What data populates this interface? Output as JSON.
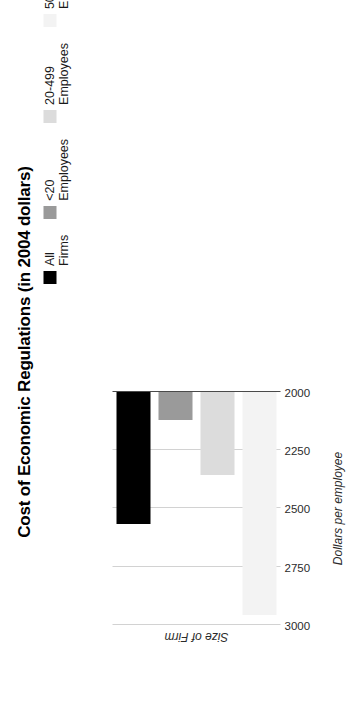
{
  "chart_data": {
    "type": "bar",
    "orientation": "horizontal",
    "title": "Cost of Economic Regulations (in 2004 dollars)",
    "xlabel": "Size of Firm",
    "ylabel": "Dollars per employee",
    "categories": [
      "All Firms",
      "<20 Employees",
      "20-499 Employees",
      "500+ Employees"
    ],
    "values": [
      2565,
      2120,
      2357,
      2955
    ],
    "value_axis_ticks": [
      "2000",
      "2250",
      "2500",
      "2750",
      "3000"
    ],
    "value_axis_tick_values": [
      2000,
      2250,
      2500,
      2750,
      3000
    ],
    "ylim": [
      2000,
      3000
    ],
    "grid": true,
    "legend_position": "top-right",
    "series": [
      {
        "name": "All Firms",
        "value": 2565,
        "color": "#000000"
      },
      {
        "name": "<20 Employees",
        "value": 2120,
        "color": "#9a9a9a"
      },
      {
        "name": "20-499 Employees",
        "value": 2357,
        "color": "#dcdcdc"
      },
      {
        "name": "500+ Employees",
        "value": 2955,
        "color": "#f3f3f3"
      }
    ]
  },
  "figure": {
    "title": "Cost of Economic Regulations (in 2004 dollars)",
    "value_axis_title": "Dollars per employee",
    "category_axis_title": "Size of Firm"
  },
  "legend": {
    "entries": [
      {
        "label": "All Firms",
        "color": "#000000"
      },
      {
        "label": "<20\nEmployees",
        "color": "#9a9a9a"
      },
      {
        "label": "20-499\nEmployees",
        "color": "#dcdcdc"
      },
      {
        "label": "500+\nEmployees",
        "color": "#f3f3f3"
      }
    ]
  },
  "axis": {
    "ticks": [
      "3000",
      "2750",
      "2500",
      "2250",
      "2000"
    ],
    "min": 2000,
    "max": 3000
  },
  "colors": {
    "gridline": "#d2d2d2",
    "axisline": "#4a4a4a",
    "background": "#ffffff",
    "text": "#1a1a1a"
  }
}
